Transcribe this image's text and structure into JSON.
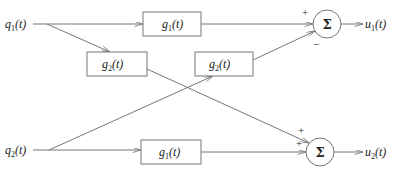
{
  "diagram": {
    "inputs": [
      {
        "id": "q1",
        "name": "q",
        "sub": "1",
        "arg": "(t)"
      },
      {
        "id": "q2",
        "name": "q",
        "sub": "2",
        "arg": "(t)"
      }
    ],
    "blocks": [
      {
        "id": "g1_top",
        "name": "g",
        "sub": "1",
        "arg": "(t)"
      },
      {
        "id": "g2_left",
        "name": "g",
        "sub": "2",
        "arg": "(t)"
      },
      {
        "id": "g2_right",
        "name": "g",
        "sub": "2",
        "arg": "(t)"
      },
      {
        "id": "g1_bottom",
        "name": "g",
        "sub": "1",
        "arg": "(t)"
      }
    ],
    "summers": [
      {
        "id": "sum1",
        "symbol": "Σ",
        "sign_top": "+",
        "sign_bottom": "−"
      },
      {
        "id": "sum2",
        "symbol": "Σ",
        "sign_top": "+",
        "sign_bottom": "+"
      }
    ],
    "outputs": [
      {
        "id": "u1",
        "name": "u",
        "sub": "1",
        "arg": "(t)"
      },
      {
        "id": "u2",
        "name": "u",
        "sub": "2",
        "arg": "(t)"
      }
    ]
  }
}
